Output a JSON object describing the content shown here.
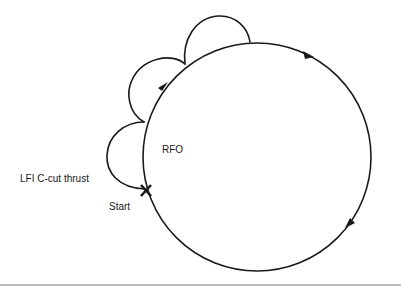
{
  "diagram": {
    "labels": {
      "center": "RFO",
      "thrust": "LFI C-cut thrust",
      "start": "Start"
    },
    "colors": {
      "stroke": "#1a1a1a",
      "background": "#ffffff",
      "divider": "#bdbdbd"
    },
    "elements": {
      "main_circle": "clockwise circular path (RFO)",
      "loops": [
        "C-cut thrust loop 1",
        "C-cut thrust loop 2",
        "C-cut thrust loop 3"
      ],
      "arrows": [
        "arrow-up-right",
        "arrow-right",
        "arrow-down-left"
      ],
      "start_marker": "x-mark"
    }
  }
}
